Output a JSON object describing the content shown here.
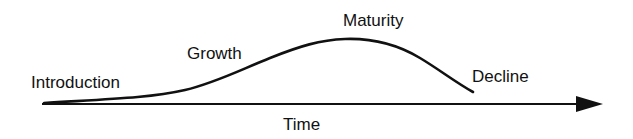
{
  "diagram": {
    "axis": {
      "label": "Time"
    },
    "stages": [
      {
        "label": "Introduction"
      },
      {
        "label": "Growth"
      },
      {
        "label": "Maturity"
      },
      {
        "label": "Decline"
      }
    ],
    "colors": {
      "line": "#111111",
      "background": "#ffffff"
    }
  }
}
